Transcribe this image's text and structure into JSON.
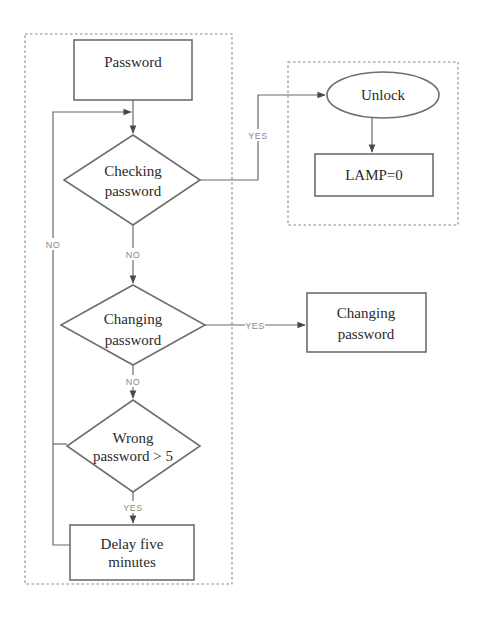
{
  "diagram": {
    "type": "flowchart",
    "title": "",
    "colors": {
      "background": "#ffffff",
      "shape_stroke": "#6e6e6e",
      "edge_stroke": "#6a6a6a",
      "group_stroke": "#888888",
      "text": "#2a2a2a",
      "edge_label": "#8a8a8a"
    },
    "groups": [
      {
        "id": "main-flow",
        "style": "dashed"
      },
      {
        "id": "unlock-group",
        "style": "dashed"
      }
    ],
    "nodes": {
      "password": {
        "shape": "rectangle",
        "lines": [
          "Password"
        ]
      },
      "checking": {
        "shape": "diamond",
        "lines": [
          "Checking",
          "password"
        ]
      },
      "changing_decision": {
        "shape": "diamond",
        "lines": [
          "Changing",
          "password"
        ]
      },
      "wrong": {
        "shape": "diamond",
        "lines": [
          "Wrong",
          "password > 5"
        ]
      },
      "delay": {
        "shape": "rectangle",
        "lines": [
          "Delay five",
          "minutes"
        ]
      },
      "unlock": {
        "shape": "ellipse",
        "lines": [
          "Unlock"
        ]
      },
      "lamp": {
        "shape": "rectangle",
        "lines": [
          "LAMP=0"
        ]
      },
      "changing_action": {
        "shape": "rectangle",
        "lines": [
          "Changing",
          "password"
        ]
      }
    },
    "edges": [
      {
        "from": "password",
        "to": "checking",
        "label": ""
      },
      {
        "from": "checking",
        "to": "unlock",
        "label": "YES"
      },
      {
        "from": "unlock",
        "to": "lamp",
        "label": ""
      },
      {
        "from": "checking",
        "to": "changing_decision",
        "label": "NO"
      },
      {
        "from": "changing_decision",
        "to": "changing_action",
        "label": "YES"
      },
      {
        "from": "changing_decision",
        "to": "wrong",
        "label": "NO"
      },
      {
        "from": "wrong",
        "to": "delay",
        "label": "YES"
      },
      {
        "from": "wrong",
        "to": "checking",
        "label": "NO"
      },
      {
        "from": "delay",
        "to": "checking",
        "label": ""
      }
    ]
  }
}
